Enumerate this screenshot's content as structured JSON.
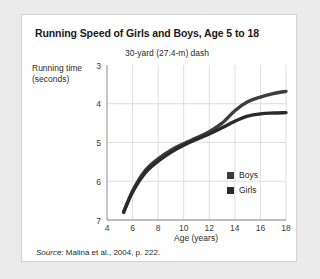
{
  "figure": {
    "title": "Running Speed of Girls and Boys, Age 5 to 18",
    "subtitle": "30-yard (27.4-m) dash",
    "source_label": "Source:",
    "source_text": " Malina et al., 2004, p. 222."
  },
  "chart_data": {
    "type": "line",
    "title": "Running Speed of Girls and Boys, Age 5 to 18",
    "subtitle": "30-yard (27.4-m) dash",
    "xlabel": "Age (years)",
    "ylabel": "Running time (seconds)",
    "ylabel_line1": "Running time",
    "ylabel_line2": "(seconds)",
    "xlim": [
      4,
      18
    ],
    "ylim": [
      3,
      7
    ],
    "y_inverted": true,
    "grid": true,
    "legend_position": "bottom-right",
    "xticks": [
      4,
      6,
      8,
      10,
      12,
      14,
      16,
      18
    ],
    "yticks": [
      3,
      4,
      5,
      6,
      7
    ],
    "xtick_labels": [
      "4",
      "6",
      "8",
      "10",
      "12",
      "14",
      "16",
      "18"
    ],
    "ytick_labels": [
      "3",
      "4",
      "5",
      "6",
      "7"
    ],
    "series": [
      {
        "name": "Boys",
        "color": "#3d3d3d",
        "x": [
          5.3,
          6,
          7,
          8,
          9,
          10,
          11,
          12,
          13,
          14,
          15,
          16,
          17,
          18
        ],
        "values": [
          6.8,
          6.25,
          5.72,
          5.42,
          5.2,
          5.03,
          4.88,
          4.72,
          4.5,
          4.18,
          3.95,
          3.83,
          3.74,
          3.68
        ]
      },
      {
        "name": "Girls",
        "color": "#2a2a2a",
        "x": [
          5.3,
          6,
          7,
          8,
          9,
          10,
          11,
          12,
          13,
          14,
          15,
          16,
          17,
          18
        ],
        "values": [
          6.8,
          6.28,
          5.78,
          5.48,
          5.25,
          5.07,
          4.92,
          4.78,
          4.62,
          4.45,
          4.32,
          4.26,
          4.24,
          4.23
        ]
      }
    ]
  },
  "legend": {
    "items": [
      {
        "label": "Boys",
        "color": "#3d3d3d"
      },
      {
        "label": "Girls",
        "color": "#2a2a2a"
      }
    ]
  }
}
